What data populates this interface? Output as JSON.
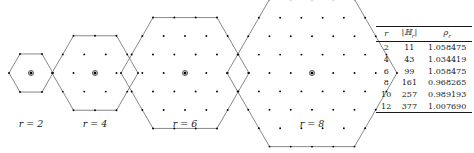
{
  "figure": {
    "caption_labels": [
      {
        "label": "r = 2",
        "var": "r",
        "value": 2
      },
      {
        "label": "r = 4",
        "var": "r",
        "value": 4
      },
      {
        "label": "r = 6",
        "var": "r",
        "value": 6
      },
      {
        "label": "r = 8",
        "var": "r",
        "value": 8
      }
    ],
    "line_color": "#555555",
    "dot_color": "#000000",
    "background": "#ffffff"
  },
  "table": {
    "headers": [
      "r",
      "|ℍ_r|",
      "ρ_r"
    ],
    "header_r": "r",
    "header_h": "|ℍ",
    "header_h_sub": "r",
    "header_h_close": "|",
    "header_rho": "ρ",
    "header_rho_sub": "r",
    "rows": [
      {
        "r": "2",
        "h": "11",
        "rho": "1.058475"
      },
      {
        "r": "4",
        "h": "43",
        "rho": "1.034419"
      },
      {
        "r": "6",
        "h": "99",
        "rho": "1.058475"
      },
      {
        "r": "8",
        "h": "161",
        "rho": "0.968265"
      },
      {
        "r": "10",
        "h": "257",
        "rho": "0.989193"
      },
      {
        "r": "12",
        "h": "377",
        "rho": "1.007690"
      }
    ]
  },
  "chart_data": {
    "type": "scatter",
    "title": "",
    "xlabel": "",
    "ylabel": "",
    "hexagons": [
      {
        "r": 2,
        "points": 11,
        "center_px": [
          31,
          73
        ],
        "radius_px": 22
      },
      {
        "r": 4,
        "points": 43,
        "center_px": [
          95,
          73
        ],
        "radius_px": 43
      },
      {
        "r": 6,
        "points": 99,
        "center_px": [
          185,
          73
        ],
        "radius_px": 64
      },
      {
        "r": 8,
        "points": 161,
        "center_px": [
          312,
          73
        ],
        "radius_px": 85
      }
    ],
    "categories": [
      "2",
      "4",
      "6",
      "8",
      "10",
      "12"
    ],
    "series": [
      {
        "name": "|H_r|",
        "values": [
          11,
          43,
          99,
          161,
          257,
          377
        ]
      },
      {
        "name": "rho_r",
        "values": [
          1.058475,
          1.034419,
          1.058475,
          0.968265,
          0.989193,
          1.00769
        ]
      }
    ]
  }
}
